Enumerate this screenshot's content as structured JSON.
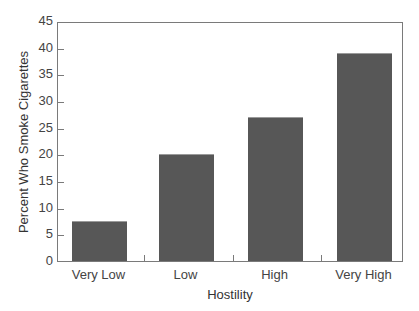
{
  "chart_data": {
    "type": "bar",
    "title": "",
    "xlabel": "Hostility",
    "ylabel": "Percent Who Smoke Cigarettes",
    "categories": [
      "Very Low",
      "Low",
      "High",
      "Very High"
    ],
    "values": [
      7.5,
      20,
      27,
      39
    ],
    "ylim": [
      0,
      45
    ],
    "yticks": [
      0,
      5,
      10,
      15,
      20,
      25,
      30,
      35,
      40,
      45
    ],
    "grid": false,
    "legend": null,
    "bar_color": "#575757"
  }
}
